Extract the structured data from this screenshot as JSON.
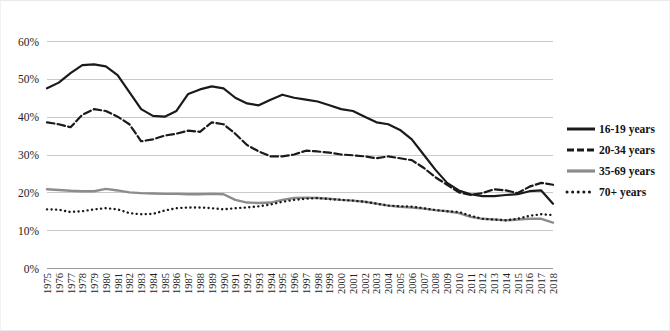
{
  "chart_data": {
    "type": "line",
    "title": "",
    "xlabel": "",
    "ylabel": "",
    "ylim": [
      0,
      60
    ],
    "yticks": [
      0,
      10,
      20,
      30,
      40,
      50,
      60
    ],
    "ytick_labels": [
      "0%",
      "10%",
      "20%",
      "30%",
      "40%",
      "50%",
      "60%"
    ],
    "grid": true,
    "legend_position": "right",
    "x": [
      1975,
      1976,
      1977,
      1978,
      1979,
      1980,
      1981,
      1982,
      1983,
      1984,
      1985,
      1986,
      1987,
      1988,
      1989,
      1990,
      1991,
      1992,
      1993,
      1994,
      1995,
      1996,
      1997,
      1998,
      1999,
      2000,
      2001,
      2002,
      2003,
      2004,
      2005,
      2006,
      2007,
      2008,
      2009,
      2010,
      2011,
      2012,
      2013,
      2014,
      2015,
      2016,
      2017,
      2018
    ],
    "categories": [
      "1975",
      "1976",
      "1977",
      "1978",
      "1979",
      "1980",
      "1981",
      "1982",
      "1983",
      "1984",
      "1985",
      "1986",
      "1987",
      "1988",
      "1989",
      "1990",
      "1991",
      "1992",
      "1993",
      "1994",
      "1995",
      "1996",
      "1997",
      "1998",
      "1999",
      "2000",
      "2001",
      "2002",
      "2003",
      "2004",
      "2005",
      "2006",
      "2007",
      "2008",
      "2009",
      "2010",
      "2011",
      "2012",
      "2013",
      "2014",
      "2015",
      "2016",
      "2017",
      "2018"
    ],
    "series": [
      {
        "name": "16-19 years",
        "style": "solid",
        "color": "#1a1a1a",
        "width": 2.2,
        "values": [
          47.5,
          49.0,
          51.5,
          53.6,
          53.8,
          53.3,
          51.0,
          46.5,
          42.0,
          40.2,
          40.0,
          41.5,
          46.0,
          47.2,
          48.0,
          47.5,
          45.0,
          43.5,
          43.0,
          44.5,
          45.8,
          45.0,
          44.5,
          44.0,
          43.0,
          42.0,
          41.5,
          40.0,
          38.5,
          38.0,
          36.5,
          34.0,
          30.0,
          26.0,
          22.5,
          20.5,
          19.5,
          19.0,
          19.0,
          19.3,
          19.5,
          20.3,
          20.5,
          17.0
        ]
      },
      {
        "name": "20-34 years",
        "style": "dashed",
        "color": "#1a1a1a",
        "width": 2.2,
        "values": [
          38.5,
          38.0,
          37.2,
          40.5,
          42.0,
          41.5,
          40.0,
          38.0,
          33.5,
          34.0,
          35.0,
          35.5,
          36.3,
          36.0,
          38.5,
          38.0,
          35.5,
          32.5,
          30.8,
          29.5,
          29.5,
          30.0,
          31.0,
          30.8,
          30.5,
          30.0,
          29.8,
          29.5,
          29.0,
          29.5,
          29.0,
          28.5,
          26.5,
          24.0,
          22.0,
          20.0,
          19.3,
          19.8,
          20.8,
          20.5,
          19.8,
          21.5,
          22.5,
          22.0
        ]
      },
      {
        "name": "35-69 years",
        "style": "solid",
        "color": "#8c8c8c",
        "width": 2.4,
        "values": [
          20.8,
          20.6,
          20.4,
          20.3,
          20.3,
          20.9,
          20.5,
          20.0,
          19.8,
          19.7,
          19.6,
          19.6,
          19.5,
          19.5,
          19.6,
          19.5,
          18.0,
          17.3,
          17.2,
          17.3,
          18.0,
          18.5,
          18.6,
          18.5,
          18.3,
          18.0,
          17.8,
          17.5,
          17.0,
          16.5,
          16.2,
          16.0,
          15.7,
          15.3,
          15.0,
          14.5,
          13.5,
          13.0,
          12.8,
          12.6,
          12.8,
          13.0,
          13.0,
          12.0
        ]
      },
      {
        "name": "70+ years",
        "style": "dotted",
        "color": "#1a1a1a",
        "width": 2.4,
        "values": [
          15.5,
          15.4,
          14.8,
          15.0,
          15.5,
          15.8,
          15.5,
          14.5,
          14.2,
          14.3,
          15.2,
          15.8,
          16.0,
          16.0,
          15.8,
          15.5,
          15.8,
          16.0,
          16.3,
          16.8,
          17.5,
          18.0,
          18.3,
          18.5,
          18.2,
          18.0,
          17.8,
          17.5,
          17.0,
          16.5,
          16.3,
          16.2,
          15.8,
          15.3,
          15.0,
          14.8,
          13.8,
          13.0,
          12.8,
          12.6,
          13.0,
          13.8,
          14.2,
          14.0
        ]
      }
    ]
  },
  "legend": {
    "items": [
      {
        "label": "16-19 years",
        "style": "solid",
        "color": "#1a1a1a"
      },
      {
        "label": "20-34 years",
        "style": "dashed",
        "color": "#1a1a1a"
      },
      {
        "label": "35-69 years",
        "style": "solid",
        "color": "#8c8c8c"
      },
      {
        "label": "70+ years",
        "style": "dotted",
        "color": "#1a1a1a"
      }
    ]
  }
}
